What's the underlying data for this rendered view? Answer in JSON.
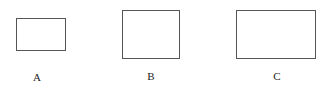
{
  "figures": [
    {
      "id": "A",
      "label": "A",
      "rect": {
        "x": 16,
        "y": 18,
        "w": 50,
        "h": 33
      },
      "label_pos": {
        "x": 37,
        "y": 72
      }
    },
    {
      "id": "B",
      "label": "B",
      "rect": {
        "x": 122,
        "y": 10,
        "w": 58,
        "h": 49
      },
      "label_pos": {
        "x": 151,
        "y": 71
      }
    },
    {
      "id": "C",
      "label": "C",
      "rect": {
        "x": 236,
        "y": 10,
        "w": 80,
        "h": 49
      },
      "label_pos": {
        "x": 277,
        "y": 71
      }
    }
  ],
  "colors": {
    "stroke": "#555555",
    "text": "#222222",
    "background": "#ffffff"
  }
}
